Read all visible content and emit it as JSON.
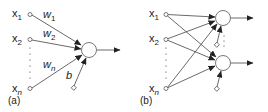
{
  "colors": {
    "line": "#444444",
    "node_stroke": "#555555",
    "text": "#222222",
    "background": "#ffffff"
  },
  "panel_a": {
    "caption": "(a)",
    "inputs": [
      {
        "name": "x",
        "sub": "1"
      },
      {
        "name": "x",
        "sub": "2"
      },
      {
        "name": "x",
        "sub": "n"
      }
    ],
    "weights": [
      {
        "name": "w",
        "sub": "1"
      },
      {
        "name": "w",
        "sub": "2"
      },
      {
        "name": "w",
        "sub": "n"
      }
    ],
    "bias": "b"
  },
  "panel_b": {
    "caption": "(b)",
    "inputs": [
      {
        "name": "x",
        "sub": "1"
      },
      {
        "name": "x",
        "sub": "2"
      },
      {
        "name": "x",
        "sub": "n"
      }
    ]
  }
}
